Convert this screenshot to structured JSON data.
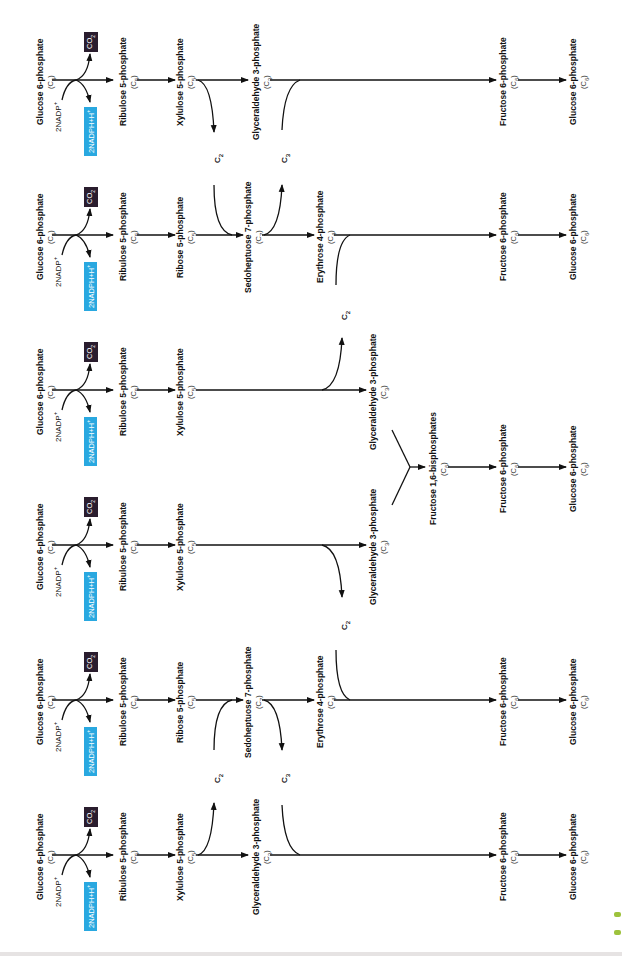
{
  "diagram": {
    "orientation": "rotated 90deg counter-clockwise",
    "colors": {
      "nadph_box": "#29a8e0",
      "co2_box": "#2a1d2e",
      "arrow": "#111111",
      "green_mark": "#9dc23c"
    },
    "oxidative_step": {
      "substrate": "Glucose 6-phosphate",
      "substrate_carbons": "(C6)",
      "cofactor_in": "2NADP+",
      "cofactor_out": "2NADPH+H+",
      "released": "CO2",
      "product": "Ribulose 5-phosphate",
      "product_carbons": "(C5)"
    },
    "rows": [
      {
        "id": "row-1",
        "y": 80,
        "compounds": [
          {
            "x": 42,
            "name": "Glucose 6-phosphate",
            "carbons": "(C6)"
          },
          {
            "x": 125,
            "name": "Ribulose 5-phosphate",
            "carbons": "(C5)"
          },
          {
            "x": 182,
            "name": "Xylulose 5-phosphate",
            "carbons": "(C5)"
          },
          {
            "x": 258,
            "name": "Glyceraldehyde 3-phosphate",
            "carbons": "(C3)"
          },
          {
            "x": 505,
            "name": "Fructose 6-phosphate",
            "carbons": "(C6)"
          },
          {
            "x": 575,
            "name": "Glucose 6-phosphate",
            "carbons": "(C6)"
          }
        ],
        "fragments": [
          {
            "x": 218,
            "y": 158,
            "label": "C2",
            "direction": "out"
          },
          {
            "x": 285,
            "y": 158,
            "label": "C3",
            "direction": "in"
          }
        ]
      },
      {
        "id": "row-2",
        "y": 235,
        "compounds": [
          {
            "x": 42,
            "name": "Glucose 6-phosphate",
            "carbons": "(C6)"
          },
          {
            "x": 125,
            "name": "Ribulose 5-phosphate",
            "carbons": "(C5)"
          },
          {
            "x": 182,
            "name": "Ribose 5-phosphate",
            "carbons": "(C5)"
          },
          {
            "x": 250,
            "name": "Sedoheptuose 7-phosphate",
            "carbons": "(C7)"
          },
          {
            "x": 322,
            "name": "Erythrose 4-phosphate",
            "carbons": "(C4)"
          },
          {
            "x": 505,
            "name": "Fructose 6-phosphate",
            "carbons": "(C6)"
          },
          {
            "x": 575,
            "name": "Glucose 6-phosphate",
            "carbons": "(C6)"
          }
        ],
        "fragments": [
          {
            "x": 218,
            "y": 158,
            "label": "C2",
            "direction": "in"
          },
          {
            "x": 285,
            "y": 158,
            "label": "C3",
            "direction": "out"
          },
          {
            "x": 345,
            "y": 315,
            "label": "C2",
            "direction": "in"
          }
        ]
      },
      {
        "id": "row-3",
        "y": 390,
        "compounds": [
          {
            "x": 42,
            "name": "Glucose 6-phosphate",
            "carbons": "(C6)"
          },
          {
            "x": 125,
            "name": "Ribulose 5-phosphate",
            "carbons": "(C5)"
          },
          {
            "x": 182,
            "name": "Xylulose 5-phosphate",
            "carbons": "(C5)"
          },
          {
            "x": 375,
            "name": "Glyceraldehyde 3-phosphate",
            "carbons": "(C3)"
          }
        ],
        "fragments": [
          {
            "x": 345,
            "y": 315,
            "label": "C2",
            "direction": "out"
          }
        ]
      },
      {
        "id": "row-4",
        "y": 545,
        "compounds": [
          {
            "x": 42,
            "name": "Glucose 6-phosphate",
            "carbons": "(C6)"
          },
          {
            "x": 125,
            "name": "Ribulose 5-phosphate",
            "carbons": "(C5)"
          },
          {
            "x": 182,
            "name": "Xylulose 5-phosphate",
            "carbons": "(C5)"
          },
          {
            "x": 375,
            "name": "Glyceraldehyde 3-phosphate",
            "carbons": "(C3)"
          }
        ],
        "fragments": [
          {
            "x": 345,
            "y": 625,
            "label": "C2",
            "direction": "out"
          }
        ]
      },
      {
        "id": "row-5",
        "y": 700,
        "compounds": [
          {
            "x": 42,
            "name": "Glucose 6-phosphate",
            "carbons": "(C6)"
          },
          {
            "x": 125,
            "name": "Ribulose 5-phosphate",
            "carbons": "(C5)"
          },
          {
            "x": 182,
            "name": "Ribose 5-phosphate",
            "carbons": "(C5)"
          },
          {
            "x": 250,
            "name": "Sedoheptuose 7-phosphate",
            "carbons": "(C7)"
          },
          {
            "x": 322,
            "name": "Erythrose 4-phosphate",
            "carbons": "(C4)"
          },
          {
            "x": 505,
            "name": "Fructose 6-phosphate",
            "carbons": "(C6)"
          },
          {
            "x": 575,
            "name": "Glucose 6-phosphate",
            "carbons": "(C6)"
          }
        ],
        "fragments": [
          {
            "x": 218,
            "y": 778,
            "label": "C2",
            "direction": "in"
          },
          {
            "x": 285,
            "y": 778,
            "label": "C3",
            "direction": "out"
          },
          {
            "x": 345,
            "y": 625,
            "label": "C2",
            "direction": "in"
          }
        ]
      },
      {
        "id": "row-6",
        "y": 855,
        "compounds": [
          {
            "x": 42,
            "name": "Glucose 6-phosphate",
            "carbons": "(C6)"
          },
          {
            "x": 125,
            "name": "Ribulose 5-phosphate",
            "carbons": "(C5)"
          },
          {
            "x": 182,
            "name": "Xylulose 5-phosphate",
            "carbons": "(C5)"
          },
          {
            "x": 258,
            "name": "Glyceraldehyde 3-phosphate",
            "carbons": "(C3)"
          },
          {
            "x": 505,
            "name": "Fructose 6-phosphate",
            "carbons": "(C6)"
          },
          {
            "x": 575,
            "name": "Glucose 6-phosphate",
            "carbons": "(C6)"
          }
        ],
        "fragments": [
          {
            "x": 218,
            "y": 778,
            "label": "C2",
            "direction": "out"
          },
          {
            "x": 285,
            "y": 778,
            "label": "C3",
            "direction": "in"
          }
        ]
      }
    ],
    "merge": {
      "y": 467,
      "compounds": [
        {
          "x": 435,
          "name": "Fructose 1,6-bisphosphates",
          "carbons": "(C6)"
        },
        {
          "x": 505,
          "name": "Fructose 6-phosphate",
          "carbons": "(C6)"
        },
        {
          "x": 575,
          "name": "Glucose 6-phosphate",
          "carbons": "(C6)"
        }
      ]
    }
  }
}
